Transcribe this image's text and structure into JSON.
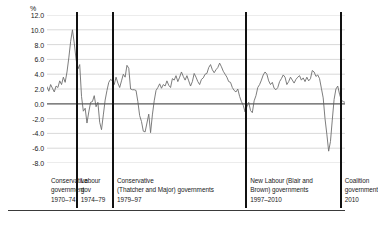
{
  "chart_data": {
    "type": "line",
    "title": "",
    "subtitle": "",
    "xlabel": "",
    "ylabel": "%",
    "unit_label": "%",
    "ylim": [
      -8.0,
      12.0
    ],
    "ytick_labels": [
      "12.0",
      "10.0",
      "8.0",
      "6.0",
      "4.0",
      "2.0",
      "0.0",
      "-2.0",
      "-4.0",
      "-6.0",
      "-8.0"
    ],
    "ytick_values": [
      12.0,
      10.0,
      8.0,
      6.0,
      4.0,
      2.0,
      0.0,
      -2.0,
      -4.0,
      -6.0,
      -8.0
    ],
    "grid": true,
    "zero_line": true,
    "legend": "none",
    "line_color": "#6e6e6e",
    "grid_color": "#c9c9c9",
    "zero_line_color": "#595959",
    "divider_color": "#111111",
    "xlim": [
      1970.0,
      2011.0
    ],
    "series": [
      {
        "name": "GDP growth",
        "x": [
          1970.0,
          1970.25,
          1970.5,
          1970.75,
          1971.0,
          1971.25,
          1971.5,
          1971.75,
          1972.0,
          1972.25,
          1972.5,
          1972.75,
          1973.0,
          1973.25,
          1973.5,
          1973.75,
          1974.0,
          1974.25,
          1974.5,
          1974.75,
          1975.0,
          1975.25,
          1975.5,
          1975.75,
          1976.0,
          1976.25,
          1976.5,
          1976.75,
          1977.0,
          1977.25,
          1977.5,
          1977.75,
          1978.0,
          1978.25,
          1978.5,
          1978.75,
          1979.0,
          1979.25,
          1979.5,
          1979.75,
          1980.0,
          1980.25,
          1980.5,
          1980.75,
          1981.0,
          1981.25,
          1981.5,
          1981.75,
          1982.0,
          1982.25,
          1982.5,
          1982.75,
          1983.0,
          1983.25,
          1983.5,
          1983.75,
          1984.0,
          1984.25,
          1984.5,
          1984.75,
          1985.0,
          1985.25,
          1985.5,
          1985.75,
          1986.0,
          1986.25,
          1986.5,
          1986.75,
          1987.0,
          1987.25,
          1987.5,
          1987.75,
          1988.0,
          1988.25,
          1988.5,
          1988.75,
          1989.0,
          1989.25,
          1989.5,
          1989.75,
          1990.0,
          1990.25,
          1990.5,
          1990.75,
          1991.0,
          1991.25,
          1991.5,
          1991.75,
          1992.0,
          1992.25,
          1992.5,
          1992.75,
          1993.0,
          1993.25,
          1993.5,
          1993.75,
          1994.0,
          1994.25,
          1994.5,
          1994.75,
          1995.0,
          1995.25,
          1995.5,
          1995.75,
          1996.0,
          1996.25,
          1996.5,
          1996.75,
          1997.0,
          1997.25,
          1997.5,
          1997.75,
          1998.0,
          1998.25,
          1998.5,
          1998.75,
          1999.0,
          1999.25,
          1999.5,
          1999.75,
          2000.0,
          2000.25,
          2000.5,
          2000.75,
          2001.0,
          2001.25,
          2001.5,
          2001.75,
          2002.0,
          2002.25,
          2002.5,
          2002.75,
          2003.0,
          2003.25,
          2003.5,
          2003.75,
          2004.0,
          2004.25,
          2004.5,
          2004.75,
          2005.0,
          2005.25,
          2005.5,
          2005.75,
          2006.0,
          2006.25,
          2006.5,
          2006.75,
          2007.0,
          2007.25,
          2007.5,
          2007.75,
          2008.0,
          2008.25,
          2008.5,
          2008.75,
          2009.0,
          2009.25,
          2009.5,
          2009.75,
          2010.0,
          2010.25,
          2010.5,
          2010.75,
          2011.0
        ],
        "values": [
          2.3,
          1.7,
          2.6,
          2.1,
          1.6,
          2.4,
          2.2,
          3.1,
          2.6,
          3.6,
          2.9,
          4.3,
          6.2,
          8.4,
          10.0,
          8.2,
          6.0,
          4.7,
          5.3,
          1.0,
          -1.0,
          -0.6,
          -2.6,
          -1.1,
          0.2,
          0.3,
          1.1,
          -0.4,
          0.2,
          -2.5,
          -3.5,
          -1.5,
          0.5,
          1.8,
          2.9,
          3.3,
          3.1,
          2.6,
          3.6,
          2.8,
          2.2,
          3.1,
          4.0,
          3.6,
          5.2,
          4.8,
          2.0,
          1.9,
          1.9,
          1.8,
          0.3,
          -1.6,
          -2.4,
          -3.7,
          -3.8,
          -2.6,
          -1.4,
          -3.9,
          -1.5,
          0.4,
          1.8,
          2.2,
          2.7,
          2.1,
          2.6,
          2.4,
          3.1,
          2.5,
          2.2,
          3.4,
          3.2,
          3.8,
          3.0,
          3.6,
          4.3,
          3.7,
          3.2,
          3.8,
          3.1,
          2.4,
          3.0,
          4.1,
          3.6,
          3.0,
          2.6,
          3.3,
          3.5,
          4.0,
          4.1,
          4.9,
          5.3,
          4.6,
          4.2,
          4.6,
          4.9,
          5.5,
          5.0,
          4.4,
          4.0,
          3.6,
          3.0,
          2.9,
          2.2,
          1.8,
          1.6,
          2.0,
          1.0,
          0.3,
          -0.2,
          -1.1,
          -0.4,
          0.2,
          -0.9,
          -1.2,
          0.4,
          1.1,
          2.2,
          2.6,
          3.2,
          3.9,
          4.3,
          4.0,
          3.1,
          2.6,
          2.9,
          2.1,
          1.9,
          2.2,
          3.0,
          3.4,
          3.9,
          3.6,
          2.6,
          3.0,
          3.6,
          3.2,
          2.8,
          3.3,
          3.6,
          3.8,
          3.2,
          3.5,
          3.0,
          3.6,
          3.1,
          3.4,
          4.5,
          4.3,
          3.7,
          3.9,
          3.4,
          2.1,
          0.8,
          -2.0,
          -4.1,
          -6.4,
          -5.1,
          -2.2,
          0.6,
          2.0,
          2.4,
          1.3,
          0.5,
          0.3,
          0.2
        ]
      }
    ],
    "periods": [
      {
        "id": "conservative-1970",
        "lines": [
          "Conservative",
          "government",
          "1970–74"
        ],
        "start": 1970.0,
        "end": 1974.08
      },
      {
        "id": "labour-1974",
        "lines": [
          "Labour",
          "gov",
          "1974–79"
        ],
        "start": 1974.08,
        "end": 1979.08
      },
      {
        "id": "conservative-1979",
        "lines": [
          "Conservative",
          "(Thatcher and Major) governments",
          "1979–97"
        ],
        "start": 1979.08,
        "end": 1997.42
      },
      {
        "id": "new-labour-1997",
        "lines": [
          "New Labour (Blair and",
          "Brown) governments",
          "1997–2010"
        ],
        "start": 1997.42,
        "end": 2010.42
      },
      {
        "id": "coalition-2010",
        "lines": [
          "Coalition",
          "government",
          "2010"
        ],
        "start": 2010.42,
        "end": 2011.0
      }
    ],
    "dividers": [
      1974.08,
      1979.08,
      1997.42,
      2010.42
    ]
  }
}
